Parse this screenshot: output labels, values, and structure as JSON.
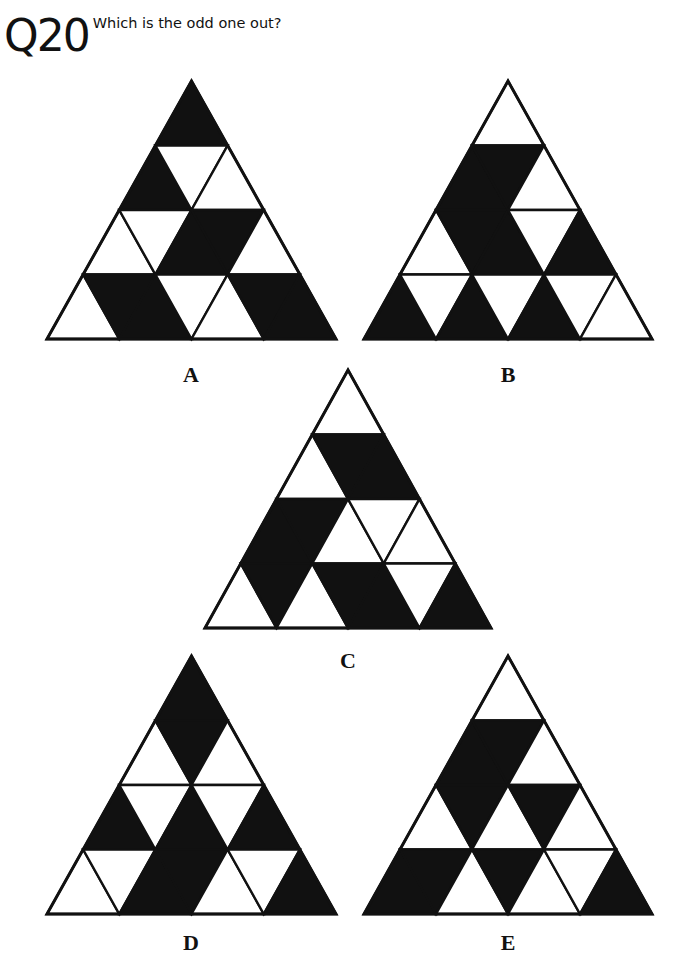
{
  "header": {
    "question_number": "Q20",
    "question_text": "Which is the odd one out?"
  },
  "colors": {
    "fill": "#111111",
    "empty": "#ffffff",
    "stroke": "#111111"
  },
  "options": [
    {
      "label": "A",
      "apex": [
        191,
        81
      ],
      "side": 289,
      "height": 258,
      "label_pos": [
        191,
        364
      ],
      "rows": [
        [
          "B"
        ],
        [
          "B",
          "W",
          "W"
        ],
        [
          "W",
          "W",
          "B",
          "B",
          "W"
        ],
        [
          "W",
          "B",
          "B",
          "W",
          "W",
          "B",
          "B"
        ]
      ]
    },
    {
      "label": "B",
      "apex": [
        508,
        81
      ],
      "side": 288,
      "height": 258,
      "label_pos": [
        508,
        364
      ],
      "rows": [
        [
          "W"
        ],
        [
          "B",
          "B",
          "W"
        ],
        [
          "W",
          "B",
          "B",
          "W",
          "B"
        ],
        [
          "B",
          "W",
          "B",
          "W",
          "B",
          "W",
          "W"
        ]
      ]
    },
    {
      "label": "C",
      "apex": [
        348,
        370
      ],
      "side": 286,
      "height": 258,
      "label_pos": [
        348,
        650
      ],
      "rows": [
        [
          "W"
        ],
        [
          "W",
          "B",
          "B"
        ],
        [
          "B",
          "B",
          "W",
          "W",
          "W"
        ],
        [
          "W",
          "B",
          "W",
          "B",
          "B",
          "W",
          "B"
        ]
      ]
    },
    {
      "label": "D",
      "apex": [
        191,
        656
      ],
      "side": 289,
      "height": 258,
      "label_pos": [
        191,
        932
      ],
      "rows": [
        [
          "B"
        ],
        [
          "W",
          "B",
          "W"
        ],
        [
          "B",
          "W",
          "B",
          "W",
          "B"
        ],
        [
          "W",
          "W",
          "B",
          "B",
          "W",
          "W",
          "B"
        ]
      ]
    },
    {
      "label": "E",
      "apex": [
        508,
        656
      ],
      "side": 288,
      "height": 258,
      "label_pos": [
        508,
        932
      ],
      "rows": [
        [
          "W"
        ],
        [
          "B",
          "B",
          "W"
        ],
        [
          "W",
          "B",
          "W",
          "B",
          "W"
        ],
        [
          "B",
          "B",
          "W",
          "B",
          "W",
          "W",
          "B"
        ]
      ]
    }
  ]
}
